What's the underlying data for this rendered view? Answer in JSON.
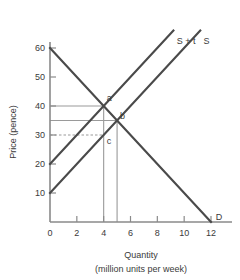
{
  "chart_data": {
    "type": "line",
    "title": "",
    "xlabel": "Quantity",
    "xlabel_sub": "(million units per week)",
    "ylabel": "Price (pence)",
    "xlim": [
      0,
      13.2
    ],
    "ylim": [
      0,
      66
    ],
    "grid": false,
    "legend_position": "inline-curve-end",
    "x_ticks": [
      0,
      2,
      4,
      6,
      8,
      10,
      12
    ],
    "x_tick_labels": [
      "0",
      "2",
      "4",
      "6",
      "8",
      "10",
      "12"
    ],
    "y_ticks": [
      10,
      20,
      30,
      40,
      50,
      60
    ],
    "y_tick_labels": [
      "10",
      "20",
      "30",
      "40",
      "50",
      "60"
    ],
    "series": [
      {
        "name": "D",
        "label": "D",
        "kind": "demand",
        "points": [
          [
            0,
            60
          ],
          [
            12,
            0
          ]
        ],
        "label_at": [
          12.35,
          1.8
        ]
      },
      {
        "name": "S",
        "label": "S",
        "kind": "supply",
        "points": [
          [
            0,
            10
          ],
          [
            11.2,
            66
          ]
        ],
        "label_at": [
          11.45,
          62.5
        ]
      },
      {
        "name": "S + t",
        "label": "S + t",
        "kind": "supply-with-tax",
        "points": [
          [
            0,
            20
          ],
          [
            9.2,
            66
          ]
        ],
        "label_at": [
          9.45,
          62.5
        ]
      }
    ],
    "annotations": [
      {
        "label": "a",
        "x": 4,
        "y": 40,
        "note": "intersection of S + t and D"
      },
      {
        "label": "b",
        "x": 5,
        "y": 35,
        "note": "intersection of S and D"
      },
      {
        "label": "c",
        "x": 4,
        "y": 30,
        "note": "point on S below a"
      }
    ],
    "reference_lines": [
      {
        "orientation": "horizontal",
        "value": 40,
        "style": "solid",
        "from_x": 0,
        "to_x": 4
      },
      {
        "orientation": "horizontal",
        "value": 35,
        "style": "solid",
        "from_x": 0,
        "to_x": 5
      },
      {
        "orientation": "horizontal",
        "value": 30,
        "style": "dashed",
        "from_x": 0,
        "to_x": 4
      },
      {
        "orientation": "vertical",
        "value": 4,
        "style": "solid",
        "from_y": 0,
        "to_y": 40
      },
      {
        "orientation": "vertical",
        "value": 5,
        "style": "solid",
        "from_y": 0,
        "to_y": 35
      }
    ],
    "colors": {
      "curve": "#4a4a4a",
      "axis": "#8a8a8a",
      "guide": "#9a9a9a",
      "text": "#3a3a3a",
      "background": "#ffffff"
    }
  }
}
